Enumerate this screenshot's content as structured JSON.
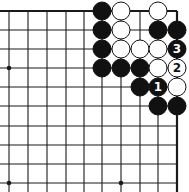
{
  "game": "Go",
  "board": {
    "description": "Top-right corner fragment of a Go board diagram",
    "cols_x": [
      9,
      28,
      47,
      66,
      84,
      102,
      121,
      140,
      158,
      177
    ],
    "rows_y": [
      11,
      30,
      49,
      68,
      87,
      106,
      126,
      145,
      164,
      183
    ],
    "line_color": "#1a1a1a",
    "background": "#ffffff",
    "edges": {
      "top": true,
      "right": true
    },
    "star_points": [
      {
        "col": 0,
        "row": 3
      },
      {
        "col": 0,
        "row": 9
      },
      {
        "col": 6,
        "row": 9
      }
    ],
    "stone_radius": 9
  },
  "stones": [
    {
      "color": "black",
      "col": 5,
      "row": 0,
      "label": ""
    },
    {
      "color": "white",
      "col": 6,
      "row": 0,
      "label": ""
    },
    {
      "color": "white",
      "col": 8,
      "row": 0,
      "label": ""
    },
    {
      "color": "black",
      "col": 5,
      "row": 1,
      "label": ""
    },
    {
      "color": "white",
      "col": 6,
      "row": 1,
      "label": ""
    },
    {
      "color": "black",
      "col": 8,
      "row": 1,
      "label": ""
    },
    {
      "color": "black",
      "col": 9,
      "row": 1,
      "label": ""
    },
    {
      "color": "black",
      "col": 5,
      "row": 2,
      "label": ""
    },
    {
      "color": "white",
      "col": 6,
      "row": 2,
      "label": ""
    },
    {
      "color": "white",
      "col": 7,
      "row": 2,
      "label": ""
    },
    {
      "color": "white",
      "col": 8,
      "row": 2,
      "label": ""
    },
    {
      "color": "black",
      "col": 9,
      "row": 2,
      "label": "3"
    },
    {
      "color": "black",
      "col": 5,
      "row": 3,
      "label": ""
    },
    {
      "color": "black",
      "col": 6,
      "row": 3,
      "label": ""
    },
    {
      "color": "black",
      "col": 7,
      "row": 3,
      "label": ""
    },
    {
      "color": "white",
      "col": 8,
      "row": 3,
      "label": ""
    },
    {
      "color": "white",
      "col": 9,
      "row": 3,
      "label": "2"
    },
    {
      "color": "black",
      "col": 7,
      "row": 4,
      "label": ""
    },
    {
      "color": "black",
      "col": 8,
      "row": 4,
      "label": "1"
    },
    {
      "color": "white",
      "col": 9,
      "row": 4,
      "label": ""
    },
    {
      "color": "black",
      "col": 8,
      "row": 5,
      "label": ""
    },
    {
      "color": "black",
      "col": 9,
      "row": 5,
      "label": ""
    }
  ],
  "move_labels": [
    "1",
    "2",
    "3"
  ]
}
